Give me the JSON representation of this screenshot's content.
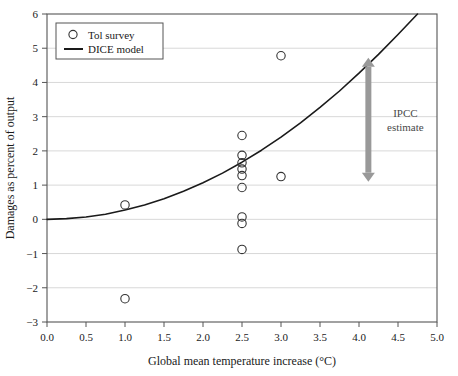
{
  "chart_data": {
    "type": "scatter",
    "title": "",
    "xlabel": "Global mean temperature increase (°C)",
    "ylabel": "Damages as percent of output",
    "xlim": [
      0.0,
      5.0
    ],
    "ylim": [
      -3,
      6
    ],
    "xticks": [
      "0.0",
      "0.5",
      "1.0",
      "1.5",
      "2.0",
      "2.5",
      "3.0",
      "3.5",
      "4.0",
      "4.5",
      "5.0"
    ],
    "xtick_values": [
      0.0,
      0.5,
      1.0,
      1.5,
      2.0,
      2.5,
      3.0,
      3.5,
      4.0,
      4.5,
      5.0
    ],
    "yticks": [
      "6",
      "5",
      "4",
      "3",
      "2",
      "1",
      "0",
      "−1",
      "−2",
      "−3"
    ],
    "ytick_values": [
      6,
      5,
      4,
      3,
      2,
      1,
      0,
      -1,
      -2,
      -3
    ],
    "grid": "horizontal",
    "legend_position": "top-left",
    "series": [
      {
        "name": "Tol survey",
        "type": "scatter",
        "marker": "open-circle",
        "color": "#333333",
        "points": [
          {
            "x": 1.0,
            "y": 0.42
          },
          {
            "x": 1.0,
            "y": -2.32
          },
          {
            "x": 2.5,
            "y": 2.45
          },
          {
            "x": 2.5,
            "y": 1.87
          },
          {
            "x": 2.5,
            "y": 1.65
          },
          {
            "x": 2.5,
            "y": 1.47
          },
          {
            "x": 2.5,
            "y": 1.28
          },
          {
            "x": 2.5,
            "y": 0.93
          },
          {
            "x": 2.5,
            "y": 0.07
          },
          {
            "x": 2.5,
            "y": -0.12
          },
          {
            "x": 2.5,
            "y": -0.88
          },
          {
            "x": 3.0,
            "y": 4.78
          },
          {
            "x": 3.0,
            "y": 1.25
          }
        ]
      },
      {
        "name": "DICE model",
        "type": "line",
        "color": "#1a1a1a",
        "description": "Quadratic damage function rising from 0 at 0 °C to 6 percent near 4.75 °C",
        "x": [
          0.0,
          0.25,
          0.5,
          0.75,
          1.0,
          1.25,
          1.5,
          1.75,
          2.0,
          2.25,
          2.5,
          2.75,
          3.0,
          3.25,
          3.5,
          3.75,
          4.0,
          4.25,
          4.5,
          4.75
        ],
        "y": [
          0.0,
          0.02,
          0.07,
          0.15,
          0.27,
          0.42,
          0.6,
          0.82,
          1.07,
          1.35,
          1.67,
          2.02,
          2.4,
          2.82,
          3.27,
          3.75,
          4.27,
          4.82,
          5.4,
          6.0
        ]
      }
    ],
    "annotations": [
      {
        "name": "ipcc-estimate",
        "label_line1": "IPCC",
        "label_line2": "estimate",
        "type": "double-headed-arrow",
        "x": 4.12,
        "y_low": 1.1,
        "y_high": 4.72,
        "color": "#999999"
      }
    ]
  },
  "legend": {
    "entries": [
      {
        "label": "Tol survey",
        "marker": "open-circle"
      },
      {
        "label": "DICE model",
        "marker": "line"
      }
    ]
  },
  "colors": {
    "background": "#ffffff",
    "axis": "#555555",
    "grid": "#d8d8d8",
    "curve": "#1a1a1a",
    "marker": "#333333",
    "arrow": "#999999"
  }
}
